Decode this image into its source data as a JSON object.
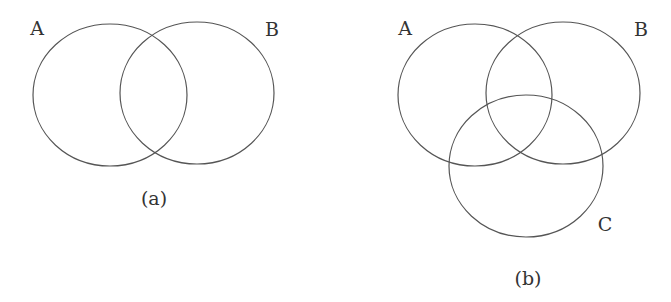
{
  "diagrams": [
    {
      "caption": "(a)",
      "sets": [
        {
          "label": "A",
          "cx": 110,
          "cy": 95,
          "rx": 77,
          "ry": 71,
          "label_x": 37,
          "label_y": 35
        },
        {
          "label": "B",
          "cx": 197,
          "cy": 93,
          "rx": 77,
          "ry": 71,
          "label_x": 272,
          "label_y": 36
        }
      ],
      "caption_x": 154,
      "caption_y": 205
    },
    {
      "caption": "(b)",
      "sets": [
        {
          "label": "A",
          "cx": 475,
          "cy": 95,
          "rx": 77,
          "ry": 71,
          "label_x": 405,
          "label_y": 35
        },
        {
          "label": "B",
          "cx": 563,
          "cy": 93,
          "rx": 77,
          "ry": 71,
          "label_x": 641,
          "label_y": 36
        },
        {
          "label": "C",
          "cx": 526,
          "cy": 166,
          "rx": 77,
          "ry": 71,
          "label_x": 605,
          "label_y": 231
        }
      ],
      "caption_x": 528,
      "caption_y": 285
    }
  ],
  "colors": {
    "stroke": "#555555",
    "text": "#333333",
    "background": "#ffffff"
  }
}
